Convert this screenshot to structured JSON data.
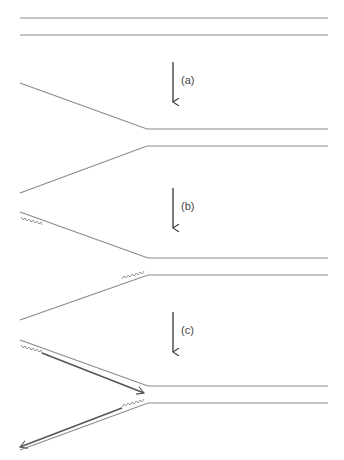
{
  "diagram": {
    "colors": {
      "strand": "#8a8a8a",
      "new_strand": "#555555",
      "arrow": "#444444"
    },
    "steps": [
      {
        "id": "a",
        "label": "(a)",
        "stage": "double-stranded DNA unwinds"
      },
      {
        "id": "b",
        "label": "(b)",
        "stage": "primers (zigzag) bind to separated strands"
      },
      {
        "id": "c",
        "label": "(c)",
        "stage": "new strands are extended from primers"
      }
    ]
  }
}
